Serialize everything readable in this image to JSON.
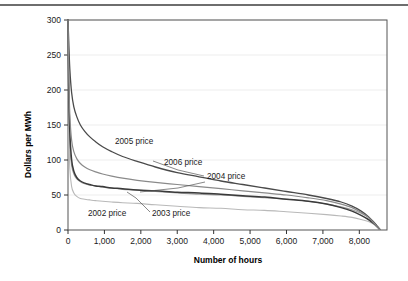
{
  "chart_data": {
    "type": "line",
    "title": "",
    "xlabel": "Number of hours",
    "ylabel": "Dollars per MWh",
    "xlim": [
      0,
      8760
    ],
    "ylim": [
      0,
      300
    ],
    "grid": true,
    "legend_position": "inline-annotations",
    "xticks": [
      0,
      1000,
      2000,
      3000,
      4000,
      5000,
      6000,
      7000,
      8000
    ],
    "xtick_labels": [
      "0",
      "1,000",
      "2,000",
      "3,000",
      "4,000",
      "5,000",
      "6,000",
      "7,000",
      "8,000"
    ],
    "yticks": [
      0,
      50,
      100,
      150,
      200,
      250,
      300
    ],
    "ytick_labels": [
      "0",
      "50",
      "100",
      "150",
      "200",
      "250",
      "300"
    ],
    "x": [
      0,
      20,
      50,
      100,
      160,
      240,
      340,
      460,
      600,
      760,
      950,
      1200,
      1500,
      1900,
      2400,
      3000,
      3600,
      4200,
      4800,
      5400,
      6000,
      6600,
      7100,
      7500,
      7800,
      8050,
      8250,
      8400,
      8500,
      8560
    ],
    "series": [
      {
        "name": "2002 price",
        "label": "2002 price",
        "color": "#b9b9b9",
        "width": 1.1,
        "values": [
          300,
          150,
          88,
          62,
          53,
          48,
          45,
          44,
          43,
          42,
          41,
          40,
          39,
          38,
          36,
          34,
          32,
          31,
          29,
          28,
          26,
          24,
          22,
          20,
          18,
          15,
          12,
          8,
          4,
          1
        ]
      },
      {
        "name": "2003 price",
        "label": "2003 price",
        "color": "#9d9d9d",
        "width": 1.1,
        "values": [
          300,
          185,
          120,
          92,
          80,
          73,
          69,
          66,
          64,
          63,
          61,
          60,
          58,
          57,
          55,
          53,
          51,
          50,
          48,
          46,
          44,
          41,
          37,
          33,
          29,
          24,
          18,
          11,
          5,
          1
        ]
      },
      {
        "name": "2004 price",
        "label": "2004 price",
        "color": "#3a3a3a",
        "width": 1.5,
        "values": [
          300,
          205,
          140,
          100,
          84,
          75,
          70,
          67,
          65,
          63,
          62,
          60,
          59,
          57,
          56,
          54,
          53,
          51,
          49,
          47,
          44,
          41,
          37,
          32,
          27,
          21,
          15,
          9,
          4,
          1
        ]
      },
      {
        "name": "2005 price",
        "label": "2005 price",
        "color": "#4a4a4a",
        "width": 1.3,
        "values": [
          300,
          270,
          230,
          196,
          176,
          162,
          150,
          141,
          133,
          126,
          119,
          112,
          105,
          98,
          90,
          82,
          76,
          70,
          65,
          60,
          55,
          50,
          45,
          40,
          34,
          27,
          19,
          11,
          5,
          1
        ]
      },
      {
        "name": "2006 price",
        "label": "2006 price",
        "color": "#8a8a8a",
        "width": 1.2,
        "values": [
          300,
          225,
          165,
          128,
          112,
          102,
          95,
          90,
          86,
          83,
          80,
          77,
          74,
          71,
          68,
          65,
          62,
          59,
          56,
          53,
          50,
          46,
          42,
          37,
          32,
          25,
          18,
          10,
          4,
          1
        ]
      }
    ],
    "annotations": [
      {
        "text": "2005 price",
        "x": 115,
        "y": 144
      },
      {
        "text": "2006 price",
        "x": 164,
        "y": 165
      },
      {
        "text": "2004 price",
        "x": 207,
        "y": 179
      },
      {
        "text": "2002 price",
        "x": 88,
        "y": 216
      },
      {
        "text": "2003 price",
        "x": 152,
        "y": 216
      }
    ]
  },
  "axes": {
    "y_title": "Dollars per MWh",
    "x_title": "Number of hours"
  }
}
